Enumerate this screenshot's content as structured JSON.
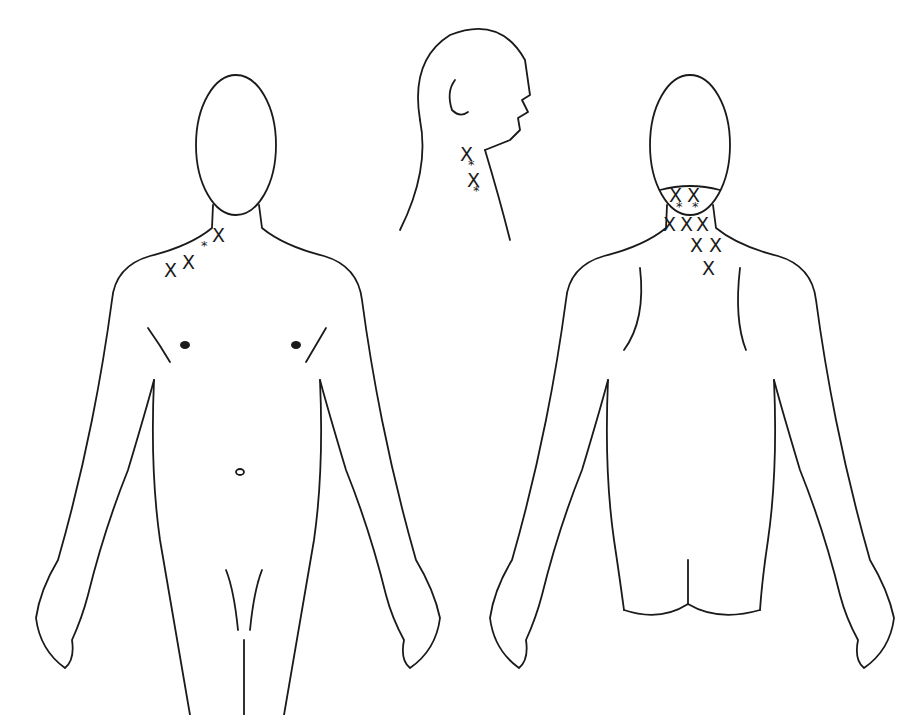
{
  "diagram": {
    "type": "body pain/trigger-point chart",
    "views": [
      {
        "name": "front",
        "markers": [
          {
            "symbol": "X",
            "x": 171,
            "y": 270
          },
          {
            "symbol": "X",
            "x": 189,
            "y": 262
          },
          {
            "symbol": "*",
            "x": 205,
            "y": 246
          },
          {
            "symbol": "X",
            "x": 219,
            "y": 235
          }
        ]
      },
      {
        "name": "side-head",
        "markers": [
          {
            "symbol": "X",
            "x": 467,
            "y": 154
          },
          {
            "symbol": "*",
            "x": 472,
            "y": 165
          },
          {
            "symbol": "X",
            "x": 474,
            "y": 180
          },
          {
            "symbol": "*",
            "x": 477,
            "y": 191
          }
        ]
      },
      {
        "name": "back",
        "markers": [
          {
            "symbol": "X",
            "x": 676,
            "y": 195
          },
          {
            "symbol": "X",
            "x": 694,
            "y": 195
          },
          {
            "symbol": "*",
            "x": 680,
            "y": 207
          },
          {
            "symbol": "*",
            "x": 696,
            "y": 207
          },
          {
            "symbol": "X",
            "x": 670,
            "y": 224
          },
          {
            "symbol": "X",
            "x": 687,
            "y": 224
          },
          {
            "symbol": "X",
            "x": 703,
            "y": 224
          },
          {
            "symbol": "X",
            "x": 697,
            "y": 245
          },
          {
            "symbol": "X",
            "x": 716,
            "y": 245
          },
          {
            "symbol": "X",
            "x": 709,
            "y": 268
          }
        ]
      }
    ],
    "legend": {
      "X": "pain",
      "*": "trigger point"
    }
  }
}
